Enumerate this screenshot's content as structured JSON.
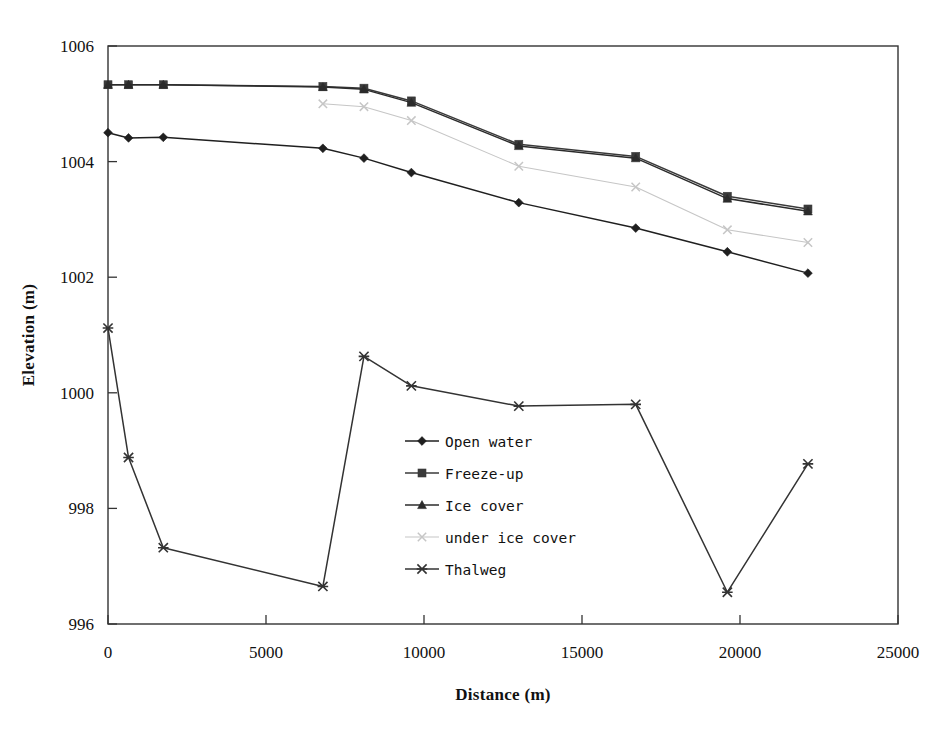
{
  "chart_data": {
    "type": "line",
    "title": "",
    "xlabel": "Distance (m)",
    "ylabel": "Elevation (m)",
    "xlim": [
      0,
      25000
    ],
    "ylim": [
      996,
      1006
    ],
    "xticks": [
      0,
      5000,
      10000,
      15000,
      20000,
      25000
    ],
    "yticks": [
      996,
      998,
      1000,
      1002,
      1004,
      1006
    ],
    "xtick_labels": [
      "0",
      "5000",
      "10000",
      "15000",
      "20000",
      "25000"
    ],
    "ytick_labels": [
      "996",
      "998",
      "1000",
      "1002",
      "1004",
      "1006"
    ],
    "grid": false,
    "legend_position": "center",
    "series": [
      {
        "name": "Open water",
        "marker": "diamond",
        "color": "#1f1f1f",
        "x": [
          0,
          650,
          1750,
          6800,
          8100,
          9600,
          13000,
          16700,
          19600,
          22150
        ],
        "y": [
          1004.5,
          1004.41,
          1004.42,
          1004.23,
          1004.06,
          1003.81,
          1003.29,
          1002.85,
          1002.44,
          1002.07
        ]
      },
      {
        "name": "Freeze-up",
        "marker": "square",
        "color": "#3a3a3a",
        "x": [
          0,
          650,
          1750,
          6800,
          8100,
          9600,
          13000,
          16700,
          19600,
          22150
        ],
        "y": [
          1005.33,
          1005.33,
          1005.33,
          1005.3,
          1005.27,
          1005.05,
          1004.3,
          1004.09,
          1003.4,
          1003.18
        ]
      },
      {
        "name": "Ice cover",
        "marker": "triangle",
        "color": "#2b2b2b",
        "x": [
          0,
          650,
          1750,
          6800,
          8100,
          9600,
          13000,
          16700,
          19600,
          22150
        ],
        "y": [
          1005.33,
          1005.33,
          1005.33,
          1005.29,
          1005.25,
          1005.02,
          1004.27,
          1004.06,
          1003.36,
          1003.14
        ]
      },
      {
        "name": "under ice cover",
        "marker": "x",
        "color": "#c6c6c6",
        "x": [
          6800,
          8100,
          9600,
          13000,
          16700,
          19600,
          22150
        ],
        "y": [
          1005.0,
          1004.95,
          1004.71,
          1003.92,
          1003.56,
          1002.82,
          1002.6
        ]
      },
      {
        "name": "Thalweg",
        "marker": "asterisk",
        "color": "#333333",
        "x": [
          0,
          650,
          1750,
          6800,
          8100,
          9600,
          13000,
          16700,
          19600,
          22150
        ],
        "y": [
          1001.12,
          998.88,
          997.32,
          996.65,
          1000.63,
          1000.12,
          999.77,
          999.8,
          996.55,
          998.77
        ]
      }
    ]
  },
  "legend": {
    "items": [
      {
        "label": "Open water",
        "marker": "diamond",
        "color": "#1f1f1f"
      },
      {
        "label": "Freeze-up",
        "marker": "square",
        "color": "#3a3a3a"
      },
      {
        "label": "Ice cover",
        "marker": "triangle",
        "color": "#2b2b2b"
      },
      {
        "label": "under ice cover",
        "marker": "x",
        "color": "#c6c6c6"
      },
      {
        "label": "Thalweg",
        "marker": "asterisk",
        "color": "#333333"
      }
    ]
  },
  "axes": {
    "x_title": "Distance (m)",
    "y_title": "Elevation (m)"
  }
}
